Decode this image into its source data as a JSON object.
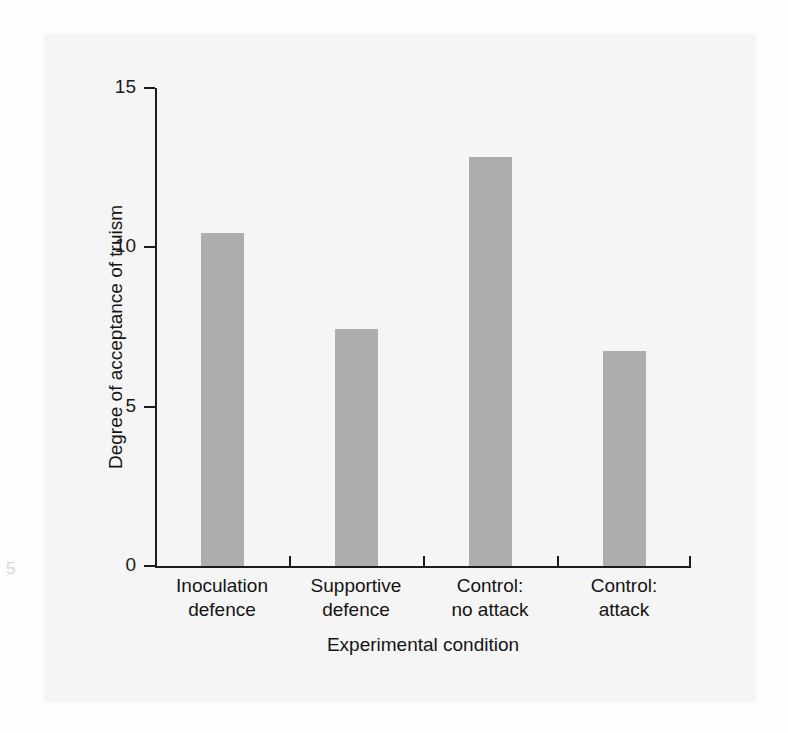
{
  "figure": {
    "background_color": "#fdfdfd",
    "panel_color": "#f5f5f5",
    "caption_fragment": "5"
  },
  "chart_data": {
    "type": "bar",
    "title": "",
    "xlabel": "Experimental condition",
    "ylabel": "Degree of acceptance of truism",
    "categories": [
      "Inoculation\ndefence",
      "Supportive\ndefence",
      "Control:\nno attack",
      "Control:\nattack"
    ],
    "category_lines": [
      [
        "Inoculation",
        "defence"
      ],
      [
        "Supportive",
        "defence"
      ],
      [
        "Control:",
        "no attack"
      ],
      [
        "Control:",
        "attack"
      ]
    ],
    "values": [
      10.45,
      7.45,
      12.85,
      6.75
    ],
    "ylim": [
      0,
      15
    ],
    "yticks": [
      0,
      5,
      10,
      15
    ],
    "ytick_labels": [
      "0",
      "5",
      "10",
      "15"
    ],
    "xticks_between_categories": true,
    "grid": false,
    "legend": null,
    "bar_color": "#adadad",
    "axis_color": "#1c1c1c"
  }
}
